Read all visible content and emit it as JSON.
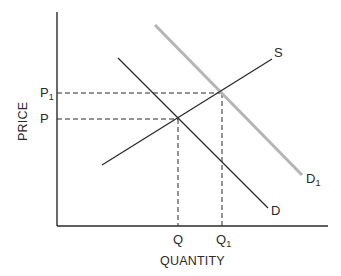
{
  "diagram": {
    "type": "supply-demand",
    "axes": {
      "x_label": "QUANTITY",
      "y_label": "PRICE"
    },
    "curves": {
      "supply": {
        "label": "S",
        "color": "#2a2a2a"
      },
      "demand": {
        "label": "D",
        "color": "#2a2a2a"
      },
      "demand_shifted": {
        "label": "D",
        "subscript": "1",
        "color": "#b5b5b5"
      }
    },
    "equilibria": {
      "initial": {
        "price_label": "P",
        "quantity_label": "Q"
      },
      "new": {
        "price_label": "P",
        "price_subscript": "1",
        "quantity_label": "Q",
        "quantity_subscript": "1"
      }
    },
    "colors": {
      "line": "#2a2a2a",
      "shifted_demand": "#b5b5b5",
      "background": "#ffffff"
    }
  }
}
